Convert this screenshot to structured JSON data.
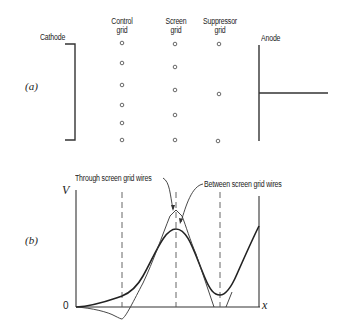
{
  "figure": {
    "part_a": {
      "label": "(a)",
      "electrodes": {
        "cathode": "Cathode",
        "control_grid": [
          "Control",
          "grid"
        ],
        "screen_grid": [
          "Screen",
          "grid"
        ],
        "suppressor_grid": [
          "Suppressor",
          "grid"
        ],
        "anode": "Anode"
      },
      "wire_counts": {
        "control_grid": 6,
        "screen_grid": 5,
        "suppressor_grid": 3
      }
    },
    "part_b": {
      "label": "(b)",
      "y_axis_label": "V",
      "x_axis_label": "x",
      "origin_label": "0",
      "annotations": {
        "through": "Through screen grid wires",
        "between": "Between screen grid wires"
      }
    }
  },
  "colors": {
    "ink": "#222222",
    "background": "#ffffff"
  }
}
